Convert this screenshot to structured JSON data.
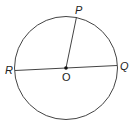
{
  "diagram": {
    "type": "circle-geometry",
    "stroke_color": "#333333",
    "labels": {
      "center": "O",
      "point_top": "P",
      "point_left": "R",
      "point_right": "Q"
    },
    "segments": [
      "OP",
      "RQ"
    ]
  }
}
